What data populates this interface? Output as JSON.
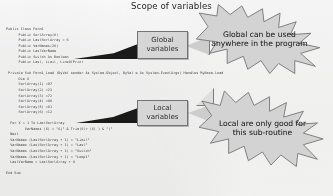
{
  "title": "Scope of variables",
  "colors": {
    "callout_fill": "#d9d9d9",
    "callout_border": "#6f6f6f",
    "arrow_fill": "#111111",
    "page_background": "#fdfdfc",
    "code_text": "#2a2a2a"
  },
  "callout_boxes": {
    "global": {
      "line1": "Global",
      "line2": "variables"
    },
    "local": {
      "line1": "Local",
      "line2": "variables"
    }
  },
  "starbursts": {
    "global": {
      "line1": "Global can be used",
      "line2": "anywhere in the program"
    },
    "local": {
      "line1": "Local are only good for",
      "line2": "this sub-routine"
    }
  },
  "code": {
    "language": "VB.NET",
    "lines": [
      "Public Class Form1",
      "      Public SortArray(8)",
      "      Public LastSortArray = 6",
      "      Public VarNames(28)",
      "      Public LastVarName",
      "      Public Switch As Boolean",
      "      Public Last, Limit, LineOfPrint",
      "",
      " Private Sub Form1_Load (ByVal sender As System.Object, ByVal e As System.EventArgs) Handles MyBase.Load",
      "      Dim X",
      "      SortArray(1) =97",
      "      SortArray(2) =23",
      "      SortArray(3) =72",
      "      SortArray(4) =48",
      "      SortArray(5) =81",
      "      SortArray(6) =12",
      "",
      "  For X = 1 To LastSortArray",
      "         VarNames (X) = \"A|\" & Trim(Str (X) ) & \")\"",
      "  Next",
      "  VarNames (LastSortArray + 1) = \"Limit\"",
      "  VarNames (LastSortArray + 1) = \"Last\"",
      "  VarNames (LastSortArray + 1) = \"Switch\"",
      "  VarNames (LastSortArray + 1) = \"Loop1\"",
      "  LastVarName = LastSortArray + 4",
      "",
      "End Sub"
    ]
  }
}
